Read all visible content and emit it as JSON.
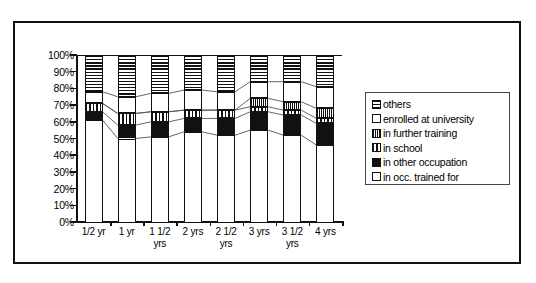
{
  "chart_data": {
    "type": "bar",
    "subtype": "100% stacked column",
    "title": "",
    "xlabel": "",
    "ylabel": "",
    "ylim": [
      0,
      100
    ],
    "y_tick_labels": [
      "100%",
      "90%",
      "80%",
      "70%",
      "60%",
      "50%",
      "40%",
      "30%",
      "20%",
      "10%",
      "0%"
    ],
    "y_tick_values": [
      100,
      90,
      80,
      70,
      60,
      50,
      40,
      30,
      20,
      10,
      0
    ],
    "grid": false,
    "legend_position": "right",
    "categories": [
      "1/2 yr",
      "1 yr",
      "1 1/2 yrs",
      "2 yrs",
      "2 1/2 yrs",
      "3 yrs",
      "3 1/2 yrs",
      "4 yrs"
    ],
    "stack_order_bottom_to_top": [
      "in occ. trained for",
      "in other occupation",
      "in school",
      "in further training",
      "enrolled at university",
      "others"
    ],
    "series": [
      {
        "name": "in occ. trained for",
        "pattern": "white",
        "values": [
          61,
          50,
          51,
          54,
          52,
          55,
          52,
          46
        ]
      },
      {
        "name": "in other occupation",
        "pattern": "solid-black",
        "values": [
          5,
          8,
          9,
          8,
          10,
          11,
          12,
          13
        ]
      },
      {
        "name": "in school",
        "pattern": "vertical",
        "values": [
          5,
          7,
          6,
          5,
          5,
          3,
          3,
          3
        ]
      },
      {
        "name": "in further training",
        "pattern": "checkered",
        "values": [
          0,
          0,
          0,
          0,
          0,
          5,
          5,
          6
        ]
      },
      {
        "name": "enrolled at university",
        "pattern": "white",
        "values": [
          7,
          10,
          11,
          12,
          11,
          10,
          12,
          13
        ]
      },
      {
        "name": "others",
        "pattern": "horizontal",
        "values": [
          22,
          25,
          23,
          21,
          22,
          16,
          16,
          19
        ]
      }
    ]
  },
  "legend": {
    "items": [
      {
        "label": "others",
        "pattern": "horizontal"
      },
      {
        "label": "enrolled at university",
        "pattern": "white"
      },
      {
        "label": "in further training",
        "pattern": "checkered"
      },
      {
        "label": "in school",
        "pattern": "vertical"
      },
      {
        "label": "in other occupation",
        "pattern": "solid-black"
      },
      {
        "label": "in occ. trained for",
        "pattern": "white"
      }
    ]
  },
  "colors": {
    "ink": "#111111",
    "background": "#ffffff",
    "frame": "#111111",
    "connector": "#555555"
  }
}
